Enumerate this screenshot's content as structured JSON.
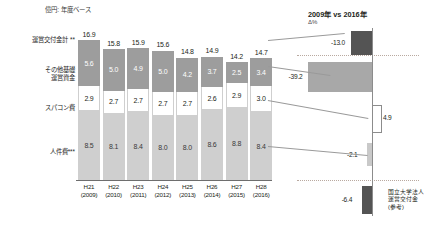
{
  "header": {
    "unit_note": "億円: 年度ベース",
    "cut_title": ""
  },
  "left_panel": {
    "row_labels": {
      "total": "運営交付金計 **",
      "other": "その他基礎\n運営資金",
      "spacon": "スパコン費",
      "jinken": "人件費***"
    },
    "row_label_total": "運営交付金計 **",
    "row_label_other_1": "その他基礎",
    "row_label_other_2": "運営資金",
    "row_label_spacon": "スパコン費",
    "row_label_jinken": "人件費***"
  },
  "right_panel": {
    "title": "2009年 vs 2016年",
    "subtitle": "Δ%",
    "legend_1": "国立大学法人",
    "legend_2": "運営交付金",
    "legend_3": "(参考)"
  },
  "chart_data": {
    "type": "bar",
    "title": "",
    "subtitle": "億円: 年度ベース",
    "xlabel": "",
    "ylabel": "",
    "stacked": true,
    "categories": [
      "H21",
      "H22",
      "H23",
      "H24",
      "H25",
      "H26",
      "H27",
      "H28"
    ],
    "category_years": [
      "(2009)",
      "(2010)",
      "(2011)",
      "(2012)",
      "(2013)",
      "(2014)",
      "(2015)",
      "(2016)"
    ],
    "totals": [
      16.9,
      15.8,
      15.9,
      15.6,
      14.8,
      14.9,
      14.2,
      14.7
    ],
    "series": [
      {
        "name": "その他基礎運営資金",
        "color": "#9d9d9d",
        "values": [
          5.6,
          5.0,
          4.9,
          5.0,
          4.2,
          3.7,
          2.5,
          3.4
        ]
      },
      {
        "name": "スパコン費",
        "color": "#ffffff",
        "values": [
          2.9,
          2.7,
          2.7,
          2.7,
          2.7,
          2.6,
          2.9,
          3.0
        ]
      },
      {
        "name": "人件費",
        "color": "#cfcfcf",
        "values": [
          8.5,
          8.1,
          8.4,
          8.0,
          8.0,
          8.6,
          8.8,
          8.4
        ]
      }
    ],
    "ylim": [
      0,
      17.5
    ],
    "grid": false,
    "legend_position": "left-labels",
    "delta_chart": {
      "type": "bar",
      "title": "2009年 vs 2016年",
      "subtitle": "Δ%",
      "orientation": "horizontal",
      "zero_axis": 0,
      "items": [
        {
          "name": "運営交付金計",
          "value": -13.0,
          "label": "-13.0",
          "color": "#545454"
        },
        {
          "name": "その他基礎運営資金",
          "value": -39.2,
          "label": "-39.2",
          "color": "#a8a8a8"
        },
        {
          "name": "スパコン費",
          "value": 4.9,
          "label": "4.9",
          "color": "#ffffff"
        },
        {
          "name": "人件費",
          "value": -2.1,
          "label": "-2.1",
          "color": "#c9c9c9"
        },
        {
          "name": "国立大学法人運営交付金(参考)",
          "value": -6.4,
          "label": "-6.4",
          "color": "#545454"
        }
      ]
    }
  }
}
